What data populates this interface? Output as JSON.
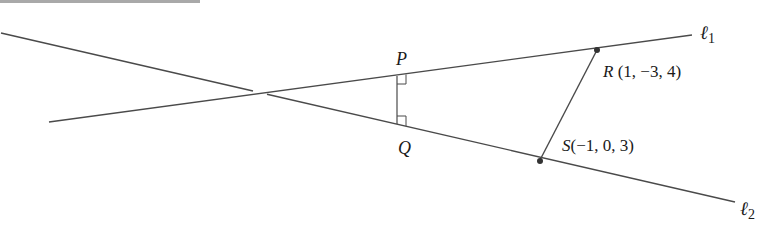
{
  "header_bar": {
    "color": "#a9a9a9"
  },
  "lines": {
    "l1": {
      "label": "ℓ",
      "subscript": "1"
    },
    "l2": {
      "label": "ℓ",
      "subscript": "2"
    }
  },
  "points": {
    "P": {
      "name": "P"
    },
    "Q": {
      "name": "Q"
    },
    "R": {
      "name": "R",
      "coords": " (1, −3, 4)"
    },
    "S": {
      "name": "S",
      "coords": "(−1, 0, 3)"
    }
  },
  "colors": {
    "line": "#4a4a4a",
    "text": "#1a1a1a"
  }
}
